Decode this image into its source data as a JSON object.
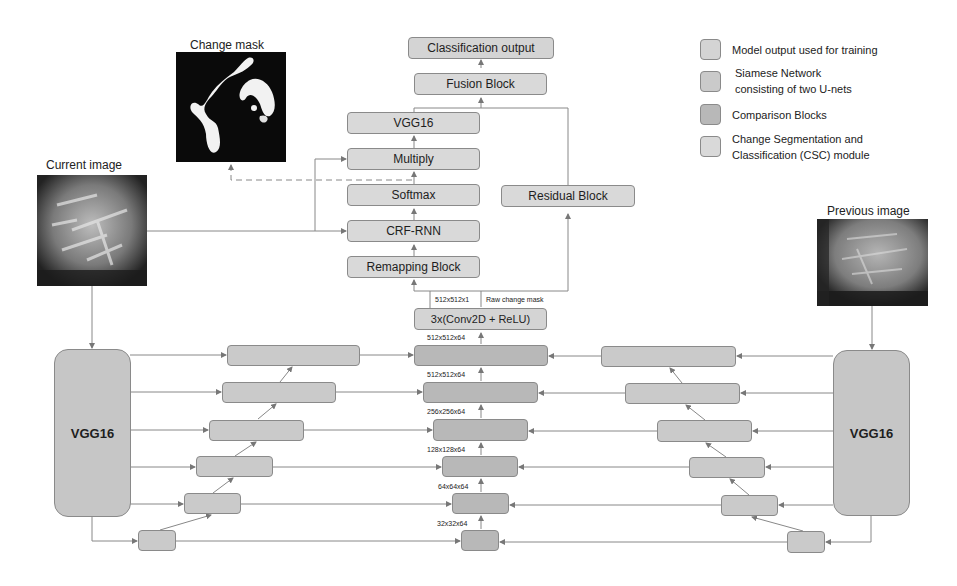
{
  "legend": {
    "items": [
      {
        "label": "Model output used for training",
        "color": "#d4d4d4"
      },
      {
        "label": "Siamese Network",
        "label2": "consisting of two U-nets",
        "color": "#cacaca"
      },
      {
        "label": "Comparison Blocks",
        "color": "#b8b8b8"
      },
      {
        "label": "Change Segmentation and",
        "label2": "Classification (CSC) module",
        "color": "#d9d9d9"
      }
    ]
  },
  "images": {
    "change_mask": "Change mask",
    "current": "Current image",
    "previous": "Previous image"
  },
  "csc": {
    "classification_output": "Classification output",
    "fusion": "Fusion Block",
    "vgg16": "VGG16",
    "multiply": "Multiply",
    "softmax": "Softmax",
    "crf_rnn": "CRF-RNN",
    "remapping": "Remapping Block",
    "residual": "Residual Block",
    "conv": "3x(Conv2D + ReLU)"
  },
  "labels": {
    "raw_dim": "512x512x1",
    "raw_text": "Raw change mask",
    "dims": [
      "512x512x64",
      "512x512x64",
      "256x256x64",
      "128x128x64",
      "64x64x64",
      "32x32x64"
    ]
  },
  "unet": {
    "left_encoder": "VGG16",
    "right_encoder": "VGG16"
  },
  "colors": {
    "line": "#777777",
    "csc": "#d9d9d9",
    "siamese": "#cacaca",
    "comparison": "#b8b8b8"
  }
}
